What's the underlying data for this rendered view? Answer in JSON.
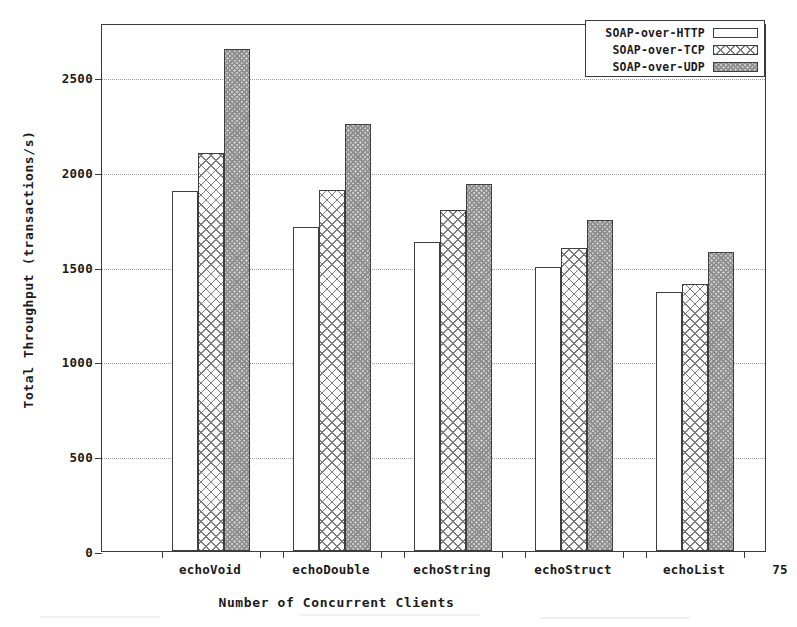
{
  "chart_data": {
    "type": "bar",
    "title": "",
    "xlabel": "Number of Concurrent Clients",
    "ylabel": "Total Throughput (transactions/s)",
    "categories": [
      "echoVoid",
      "echoDouble",
      "echoString",
      "echoStruct",
      "echoList"
    ],
    "extra_axis_label": "75",
    "series": [
      {
        "name": "SOAP-over-HTTP",
        "fill": "empty",
        "values": [
          1900,
          1710,
          1630,
          1500,
          1365
        ]
      },
      {
        "name": "SOAP-over-TCP",
        "fill": "crosshatch",
        "values": [
          2100,
          1905,
          1800,
          1600,
          1410
        ]
      },
      {
        "name": "SOAP-over-UDP",
        "fill": "stipple",
        "values": [
          2650,
          2250,
          1935,
          1745,
          1575
        ]
      }
    ],
    "ylim": [
      0,
      2785
    ],
    "yticks": [
      0,
      500,
      1000,
      1500,
      2000,
      2500
    ],
    "ytick_labels": [
      "0",
      "500",
      "1000",
      "1500",
      "2000",
      "2500"
    ],
    "grid": true,
    "grid_axis": "y",
    "legend_position": "top-right",
    "colors": {
      "axis": "#3a3a3a",
      "grid": "#9a9a9a",
      "bar_outline": "#3f3f3f",
      "text": "#1a1a1a",
      "http_fill": "#ffffff",
      "tcp_fill": "#fbfbfb",
      "udp_fill": "#c9c9c9"
    }
  },
  "legend": {
    "items": [
      {
        "label": "SOAP-over-HTTP"
      },
      {
        "label": "SOAP-over-TCP"
      },
      {
        "label": "SOAP-over-UDP"
      }
    ]
  }
}
